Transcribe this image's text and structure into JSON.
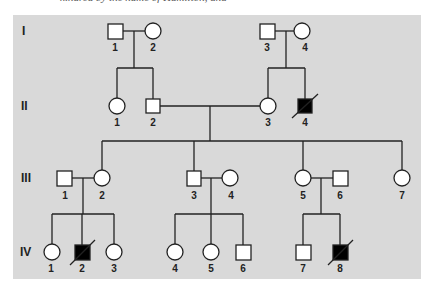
{
  "caption": "kindred by the name of Hamilton, and",
  "colors": {
    "background": "#d9d9d9",
    "unaffected_fill": "#ffffff",
    "affected_fill": "#000000",
    "line": "#222222"
  },
  "generations": [
    {
      "label": "I"
    },
    {
      "label": "II"
    },
    {
      "label": "III"
    },
    {
      "label": "IV"
    }
  ],
  "individuals": {
    "I": [
      {
        "id": "1",
        "sex": "male",
        "affected": false,
        "deceased": false
      },
      {
        "id": "2",
        "sex": "female",
        "affected": false,
        "deceased": false
      },
      {
        "id": "3",
        "sex": "male",
        "affected": false,
        "deceased": false
      },
      {
        "id": "4",
        "sex": "female",
        "affected": false,
        "deceased": false
      }
    ],
    "II": [
      {
        "id": "1",
        "sex": "female",
        "affected": false,
        "deceased": false
      },
      {
        "id": "2",
        "sex": "male",
        "affected": false,
        "deceased": false
      },
      {
        "id": "3",
        "sex": "female",
        "affected": false,
        "deceased": false
      },
      {
        "id": "4",
        "sex": "male",
        "affected": true,
        "deceased": true
      }
    ],
    "III": [
      {
        "id": "1",
        "sex": "male",
        "affected": false,
        "deceased": false
      },
      {
        "id": "2",
        "sex": "female",
        "affected": false,
        "deceased": false
      },
      {
        "id": "3",
        "sex": "male",
        "affected": false,
        "deceased": false
      },
      {
        "id": "4",
        "sex": "female",
        "affected": false,
        "deceased": false
      },
      {
        "id": "5",
        "sex": "female",
        "affected": false,
        "deceased": false
      },
      {
        "id": "6",
        "sex": "male",
        "affected": false,
        "deceased": false
      },
      {
        "id": "7",
        "sex": "female",
        "affected": false,
        "deceased": false
      }
    ],
    "IV": [
      {
        "id": "1",
        "sex": "female",
        "affected": false,
        "deceased": false
      },
      {
        "id": "2",
        "sex": "male",
        "affected": true,
        "deceased": true
      },
      {
        "id": "3",
        "sex": "female",
        "affected": false,
        "deceased": false
      },
      {
        "id": "4",
        "sex": "female",
        "affected": false,
        "deceased": false
      },
      {
        "id": "5",
        "sex": "female",
        "affected": false,
        "deceased": false
      },
      {
        "id": "6",
        "sex": "male",
        "affected": false,
        "deceased": false
      },
      {
        "id": "7",
        "sex": "male",
        "affected": false,
        "deceased": false
      },
      {
        "id": "8",
        "sex": "male",
        "affected": true,
        "deceased": true
      }
    ]
  }
}
